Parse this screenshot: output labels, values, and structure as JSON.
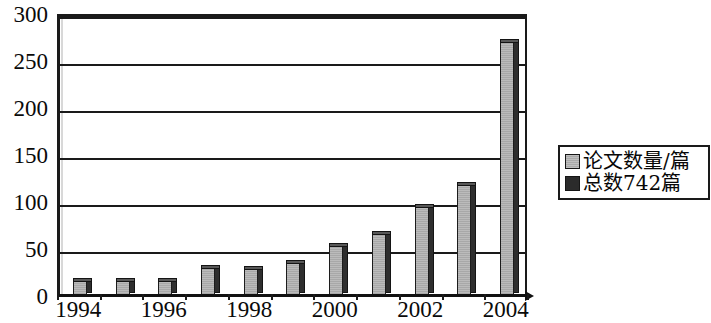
{
  "chart_data": {
    "type": "bar",
    "title": "",
    "subtitle": "",
    "xlabel": "",
    "ylabel": "",
    "categories": [
      "1994",
      "1995",
      "1996",
      "1997",
      "1998",
      "1999",
      "2000",
      "2001",
      "2002",
      "2003",
      "2004"
    ],
    "x_tick_labels": [
      "1994",
      "1996",
      "1998",
      "2000",
      "2002",
      "2004"
    ],
    "y_tick_labels": [
      "0",
      "50",
      "100",
      "150",
      "200",
      "250",
      "300"
    ],
    "y_ticks": [
      0,
      50,
      100,
      150,
      200,
      250,
      300
    ],
    "ylim": [
      0,
      300
    ],
    "grid": "horizontal",
    "legend_position": "right",
    "series": [
      {
        "name": "论文数量/篇",
        "color": "#a8a8a8",
        "values": [
          16,
          16,
          16,
          30,
          29,
          35,
          53,
          66,
          95,
          118,
          270
        ]
      }
    ],
    "legend": [
      {
        "label": "论文数量/篇",
        "swatch": "light",
        "color": "#a8a8a8"
      },
      {
        "label": "总数742篇",
        "swatch": "dark",
        "color": "#2b2b2b"
      }
    ],
    "annotations": [],
    "colors": {
      "bar_fill": "#a8a8a8",
      "bar_shadow": "#2e2e2e",
      "axis": "#1a1a1a",
      "background": "#ffffff",
      "text": "#0a0a0a"
    }
  }
}
